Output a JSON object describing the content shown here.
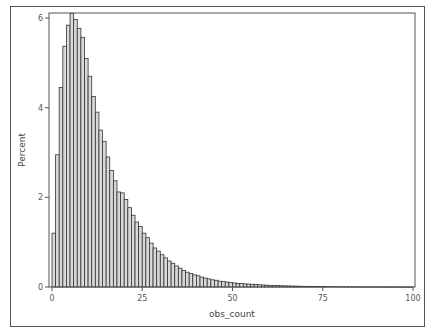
{
  "chart_data": {
    "type": "bar",
    "title": "",
    "xlabel": "obs_count",
    "ylabel": "Percent",
    "xlim": [
      0,
      100
    ],
    "ylim": [
      0,
      6.15
    ],
    "xticks": [
      0,
      25,
      50,
      75,
      100
    ],
    "yticks": [
      0,
      2,
      4,
      6
    ],
    "bin_width": 1,
    "grid": false,
    "legend": null,
    "bar_fill": "#d9d9d9",
    "bar_stroke": "#333333",
    "x": [
      0,
      1,
      2,
      3,
      4,
      5,
      6,
      7,
      8,
      9,
      10,
      11,
      12,
      13,
      14,
      15,
      16,
      17,
      18,
      19,
      20,
      21,
      22,
      23,
      24,
      25,
      26,
      27,
      28,
      29,
      30,
      31,
      32,
      33,
      34,
      35,
      36,
      37,
      38,
      39,
      40,
      41,
      42,
      43,
      44,
      45,
      46,
      47,
      48,
      49,
      50,
      51,
      52,
      53,
      54,
      55,
      56,
      57,
      58,
      59,
      60,
      61,
      62,
      63,
      64,
      65,
      66,
      67,
      68,
      69,
      70,
      71,
      72,
      73,
      74,
      75,
      76,
      77,
      78,
      79,
      80,
      81,
      82,
      83,
      84,
      85,
      86,
      87,
      88,
      89,
      90,
      91,
      92,
      93,
      94,
      95,
      96,
      97,
      98,
      99
    ],
    "values": [
      1.2,
      2.95,
      4.45,
      5.37,
      5.84,
      6.1,
      5.97,
      5.77,
      5.57,
      5.1,
      4.7,
      4.25,
      3.9,
      3.5,
      3.25,
      2.9,
      2.6,
      2.37,
      2.12,
      2.1,
      1.95,
      1.77,
      1.6,
      1.45,
      1.35,
      1.2,
      1.1,
      0.98,
      0.87,
      0.8,
      0.72,
      0.65,
      0.58,
      0.53,
      0.47,
      0.42,
      0.37,
      0.33,
      0.3,
      0.27,
      0.25,
      0.22,
      0.2,
      0.18,
      0.16,
      0.15,
      0.13,
      0.12,
      0.11,
      0.1,
      0.09,
      0.08,
      0.075,
      0.07,
      0.065,
      0.06,
      0.055,
      0.05,
      0.045,
      0.04,
      0.037,
      0.034,
      0.031,
      0.028,
      0.025,
      0.023,
      0.021,
      0.019,
      0.017,
      0.015,
      0.014,
      0.013,
      0.012,
      0.011,
      0.01,
      0.009,
      0.008,
      0.008,
      0.007,
      0.007,
      0.006,
      0.006,
      0.005,
      0.005,
      0.004,
      0.004,
      0.004,
      0.003,
      0.003,
      0.003,
      0.003,
      0.002,
      0.002,
      0.002,
      0.002,
      0.002,
      0.001,
      0.001,
      0.001,
      0.001
    ]
  },
  "layout": {
    "plot_left": 49,
    "plot_top": 13,
    "plot_right": 415,
    "plot_bottom": 287,
    "x0_px": 52,
    "x100_px": 413,
    "y0_px": 287,
    "y6_px": 18
  }
}
